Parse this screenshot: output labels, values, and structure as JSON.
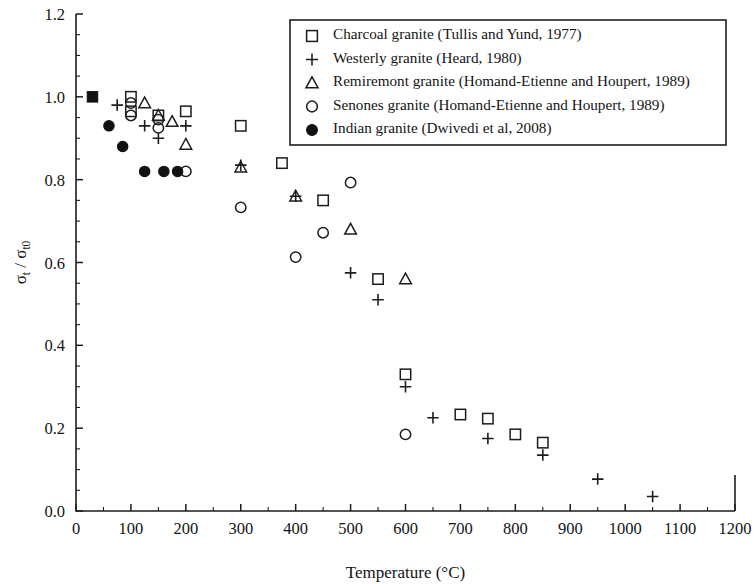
{
  "chart_data": {
    "type": "scatter",
    "title": "",
    "xlabel": "Temperature (°C)",
    "ylabel": "σt/σt0",
    "xlim": [
      0,
      1200
    ],
    "ylim": [
      0.0,
      1.2
    ],
    "xticks": [
      0,
      100,
      200,
      300,
      400,
      500,
      600,
      700,
      800,
      900,
      1000,
      1100,
      1200
    ],
    "xtick_labels": [
      "0",
      "100",
      "200",
      "300",
      "400",
      "500",
      "600",
      "700",
      "800",
      "900",
      "1000",
      "1100",
      "1200"
    ],
    "yticks": [
      0.0,
      0.2,
      0.4,
      0.6,
      0.8,
      1.0,
      1.2
    ],
    "ytick_labels": [
      "0.0",
      "0.2",
      "0.4",
      "0.6",
      "0.8",
      "1.0",
      "1.2"
    ],
    "x_minor_step": 50,
    "y_minor_step": 0.05,
    "grid": false,
    "legend_position": "top-right",
    "series": [
      {
        "name": "Charcoal granite (Tullis and Yund, 1977)",
        "marker": "open-square",
        "color": "#1d1d1d",
        "points": [
          [
            100,
            1.0
          ],
          [
            100,
            0.965
          ],
          [
            150,
            0.955
          ],
          [
            200,
            0.965
          ],
          [
            300,
            0.93
          ],
          [
            375,
            0.84
          ],
          [
            450,
            0.75
          ],
          [
            550,
            0.56
          ],
          [
            600,
            0.33
          ],
          [
            700,
            0.233
          ],
          [
            750,
            0.223
          ],
          [
            800,
            0.185
          ],
          [
            850,
            0.165
          ]
        ]
      },
      {
        "name": "Westerly granite (Heard, 1980)",
        "marker": "plus",
        "color": "#1d1d1d",
        "points": [
          [
            75,
            0.98
          ],
          [
            125,
            0.93
          ],
          [
            150,
            0.9
          ],
          [
            200,
            0.93
          ],
          [
            300,
            0.835
          ],
          [
            400,
            0.76
          ],
          [
            500,
            0.575
          ],
          [
            550,
            0.51
          ],
          [
            600,
            0.3
          ],
          [
            650,
            0.225
          ],
          [
            750,
            0.175
          ],
          [
            850,
            0.135
          ],
          [
            950,
            0.077
          ],
          [
            1050,
            0.035
          ]
        ]
      },
      {
        "name": "Remiremont granite (Homand-Etienne and Houpert, 1989)",
        "marker": "open-triangle",
        "color": "#1d1d1d",
        "points": [
          [
            125,
            0.985
          ],
          [
            150,
            0.955
          ],
          [
            175,
            0.94
          ],
          [
            200,
            0.885
          ],
          [
            300,
            0.83
          ],
          [
            400,
            0.76
          ],
          [
            500,
            0.68
          ],
          [
            600,
            0.56
          ]
        ]
      },
      {
        "name": "Senones granite (Homand-Etienne and Houpert, 1989)",
        "marker": "open-circle",
        "color": "#1d1d1d",
        "points": [
          [
            100,
            0.985
          ],
          [
            100,
            0.955
          ],
          [
            150,
            0.945
          ],
          [
            150,
            0.925
          ],
          [
            200,
            0.82
          ],
          [
            300,
            0.733
          ],
          [
            400,
            0.613
          ],
          [
            450,
            0.672
          ],
          [
            500,
            0.793
          ],
          [
            600,
            0.185
          ]
        ]
      },
      {
        "name": "Indian granite (Dwivedi et al, 2008)",
        "marker": "filled-circle",
        "color": "#111111",
        "points": [
          [
            60,
            0.93
          ],
          [
            85,
            0.88
          ],
          [
            125,
            0.82
          ],
          [
            160,
            0.82
          ],
          [
            185,
            0.82
          ]
        ]
      },
      {
        "name": "reference-origin",
        "marker": "filled-square",
        "color": "#111111",
        "legend": false,
        "points": [
          [
            30,
            1.0
          ]
        ]
      }
    ]
  },
  "legend": {
    "entries": [
      {
        "marker": "open-square",
        "label": "Charcoal granite (Tullis and Yund, 1977)"
      },
      {
        "marker": "plus",
        "label": "Westerly granite (Heard, 1980)"
      },
      {
        "marker": "open-triangle",
        "label": "Remiremont granite (Homand-Etienne and Houpert, 1989)"
      },
      {
        "marker": "open-circle",
        "label": "Senones granite (Homand-Etienne and Houpert, 1989)"
      },
      {
        "marker": "filled-circle",
        "label": "Indian granite (Dwivedi et al, 2008)"
      }
    ]
  }
}
